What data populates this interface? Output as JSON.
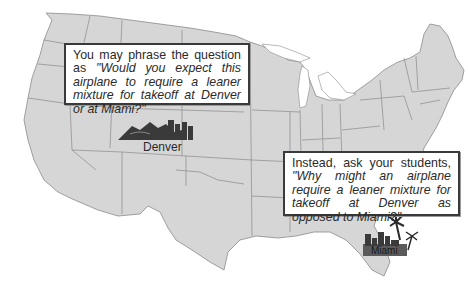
{
  "figure": {
    "colors": {
      "land": "#d6d6d6",
      "state_border": "#8a8a8a",
      "callout_border": "#3a3a3a",
      "icon_dark": "#3a3a3a"
    }
  },
  "callouts": [
    {
      "lead": "You may phrase the question as",
      "quote": "\"Would you expect this airplane to require a leaner mixture for takeoff at Denver or at Miami?\""
    },
    {
      "lead": "Instead, ask your students,",
      "quote": "\"Why might an airplane require a leaner mixture for takeoff at Denver as opposed to Miami?\""
    }
  ],
  "cities": {
    "denver": {
      "label": "Denver",
      "icon": "mountain-skyline-icon"
    },
    "miami": {
      "label": "Miami",
      "icon": "palm-skyline-icon"
    }
  }
}
